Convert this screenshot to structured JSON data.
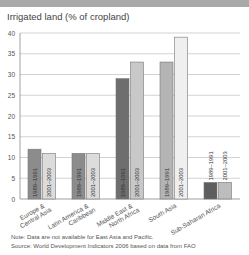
{
  "chart_data": {
    "type": "bar",
    "title": "Irrigated land (% of cropland)",
    "xlabel": "",
    "ylabel": "",
    "ylim": [
      0,
      40
    ],
    "yticks": [
      0,
      5,
      10,
      15,
      20,
      25,
      30,
      35,
      40
    ],
    "grid": true,
    "categories": [
      "Europe & Central Asia",
      "Latin America & Caribbean",
      "Middle East & North Africa",
      "South Asia",
      "Sub-Saharan Africa"
    ],
    "category_label_lines": [
      [
        "Europe &",
        "Central Asia"
      ],
      [
        "Latin America &",
        "Caribbean"
      ],
      [
        "Middle East &",
        "North Africa"
      ],
      [
        "South Asia"
      ],
      [
        "Sub-Saharan Africa"
      ]
    ],
    "series": [
      {
        "name": "1989–1991",
        "values": [
          12,
          11,
          29,
          33,
          4
        ]
      },
      {
        "name": "2001–2003",
        "values": [
          11,
          11,
          33,
          39,
          4
        ]
      }
    ],
    "bar_colors": [
      [
        "#8c8c8c",
        "#dcdcdc"
      ],
      [
        "#8c8c8c",
        "#dcdcdc"
      ],
      [
        "#6e6e6e",
        "#c8c8c8"
      ],
      [
        "#b4b4b4",
        "#efefef"
      ],
      [
        "#5e5e5e",
        "#bdbdbd"
      ]
    ],
    "notes": [
      "Note: Data are not available for East Asia and Pacific.",
      "Source: World Development Indicators 2006 based on data from FAO"
    ]
  }
}
